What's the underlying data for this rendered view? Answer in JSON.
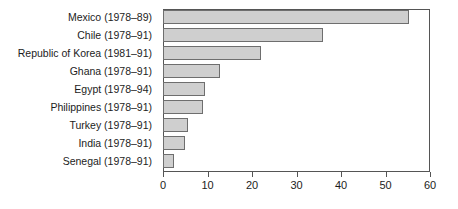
{
  "chart_data": {
    "type": "bar",
    "orientation": "horizontal",
    "title": "",
    "xlabel": "",
    "ylabel": "",
    "xlim": [
      0,
      60
    ],
    "xticks": [
      0,
      10,
      20,
      30,
      40,
      50,
      60
    ],
    "xtick_labels": [
      "0",
      "10",
      "20",
      "30",
      "40",
      "50",
      "60"
    ],
    "grid": false,
    "legend": false,
    "bar_fill_color": "#cfcfcf",
    "bar_edge_color": "#6e6e6e",
    "axis_color": "#555555",
    "categories": [
      "Mexico (1978–89)",
      "Chile (1978–91)",
      "Republic of Korea (1981–91)",
      "Ghana (1978–91)",
      "Egypt (1978–94)",
      "Philippines (1978–91)",
      "Turkey (1978–91)",
      "India (1978–91)",
      "Senegal (1978–91)"
    ],
    "values": [
      55.3,
      36,
      22,
      12.8,
      9.4,
      9,
      5.6,
      5,
      2.5
    ]
  }
}
